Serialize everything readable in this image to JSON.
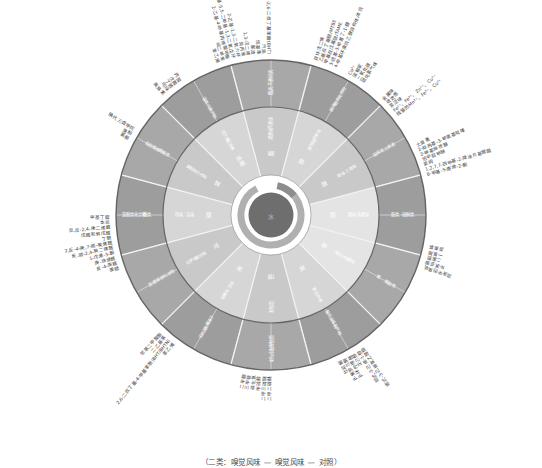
{
  "figure": {
    "caption": "（二类：嗅觉风味 — 嗅觉风味 — 对照）",
    "center_label": "水",
    "colors": {
      "outer_ring": "#a8a8a8",
      "outer_ring_alt": "#9d9d9d",
      "inner_ring": "#c9c9c9",
      "inner_ring_alt": "#d6d6d6",
      "hub_ring": "#b0b0b0",
      "hub_core": "#6e6e6e",
      "divider": "#f2f2f2",
      "edge": "#5a5a5a",
      "label_text": "#3a3a3a",
      "ring_text": "#ffffff",
      "background": "#ffffff"
    }
  },
  "chart_data": {
    "type": "pie",
    "subtitle": "",
    "xlabel": "",
    "ylabel": "",
    "legend_position": "none",
    "grid": false,
    "rings": [
      "hub",
      "inner",
      "outer",
      "external"
    ],
    "categories": [
      "芳香",
      "药味",
      "土霉味",
      "草味",
      "鱼腥味",
      "氯味",
      "金属味",
      "化学味",
      "腐败味",
      "泥土味",
      "烃味",
      "酚味"
    ],
    "values": [
      30,
      30,
      30,
      30,
      30,
      30,
      30,
      30,
      30,
      30,
      30,
      30
    ]
  },
  "wheel": {
    "hub": {
      "label": "水"
    },
    "inner_ring": [
      {
        "label": "酯"
      },
      {
        "label": "醇"
      },
      {
        "label": "醛"
      },
      {
        "label": "酮"
      },
      {
        "label": "酚"
      },
      {
        "label": "氯"
      },
      {
        "label": "硫"
      },
      {
        "label": "胺"
      },
      {
        "label": "烃"
      },
      {
        "label": "酸"
      },
      {
        "label": "醚"
      },
      {
        "label": "金属"
      }
    ],
    "mid_ring": [
      {
        "label": "芳香味 果香味"
      },
      {
        "label": "青草味 植物味"
      },
      {
        "label": "土霉味 霉味"
      },
      {
        "label": "鱼腥味 腥味"
      },
      {
        "label": "氯味 漂白水味"
      },
      {
        "label": "游泳池味"
      },
      {
        "label": "臭氧味"
      },
      {
        "label": "金属味 涩味"
      },
      {
        "label": "化学味 溶剂味"
      },
      {
        "label": "药味 苦味"
      },
      {
        "label": "腐败味 污水味"
      },
      {
        "label": "泥土味 沼泽味"
      }
    ],
    "outer_ring": [
      {
        "label": "酯类 芳香烃类"
      },
      {
        "label": "醇类 醛类化合物"
      },
      {
        "label": "萜烯类 土臭素"
      },
      {
        "label": "胺类 硫醇类"
      },
      {
        "label": "氯 氯胺类"
      },
      {
        "label": "氯代消毒副产物"
      },
      {
        "label": "臭氧 溶解性气体"
      },
      {
        "label": "金属离子 无机盐"
      },
      {
        "label": "芳香族化合物 溶剂"
      },
      {
        "label": "酚类 氯酚类化合物"
      },
      {
        "label": "醛酮类 脂肪酸类"
      },
      {
        "label": "藻类代谢产物"
      }
    ]
  },
  "external_groups": [
    {
      "group": "醚类与汽油添加剂",
      "angle_deg": -70,
      "items": [
        "双环戊二烯",
        "乙基叔丁基醚/MTBE",
        "甲基叔戊基醚/TAME",
        "3-硫基-3-甲基丁-1-醇",
        "4-甲基环庚烷乙醇异构体/本烷"
      ]
    },
    {
      "group": "芳香烃与脂环烃",
      "angle_deg": -100,
      "items": [
        "苯乙烯",
        "间二甲苯",
        "2-乙基-4-甲基丙烯酸甲酯",
        "2-乙基-5,5-二甲基-1,3-二氧戊环",
        "2-乙基-1,3-二氧六环",
        "异丙苯",
        "1,3-戊二烯",
        "鄙渣",
        "烷基苯",
        "汽油",
        "4-甲基-2,6-二叔丁基苯酚(BHT)"
      ]
    },
    {
      "group": "酚类与卤代化合物",
      "angle_deg": -150,
      "items": [
        "氯酚",
        "溴酚",
        "碘代三卤甲烷"
      ]
    },
    {
      "group": "醛酮类",
      "angle_deg": -190,
      "items": [
        "庚醛",
        "反-4-庚醛",
        "庚-炔烯醛",
        "1-戊烯-3-酮",
        "反,顺-2,4-癸二烯醛",
        "2,反-4-庚,7-顺-癸烯醛",
        "丁醛",
        "戊醛和异戊醛",
        "反,反-2,4-庚二烯醛",
        "本司",
        "甲基丁醛"
      ]
    },
    {
      "group": "抗氧剂与增塑剂",
      "angle_deg": -230,
      "items": [
        "苯乙烯",
        "2,6-二叔丁基-4-甲基苯酚(BHT/BHTN)",
        "二乙基苯",
        "邻苯二甲酸酯"
      ]
    },
    {
      "group": "胺类与硫化物",
      "angle_deg": -265,
      "items": [
        "二甲二硫醚",
        "二甲三硫醚",
        "甲硫醇",
        "硫化氢",
        "三甲胺",
        "二甲胺"
      ]
    },
    {
      "group": "萜烯与藻源化合物",
      "angle_deg": -300,
      "items": [
        "顺式-3-己烯氧乙酸酯",
        "顺式-3-己烯-1-醇",
        "正己醛",
        "β-环柠檬醛",
        "β-紫罗兰酮",
        "壮尼酮"
      ]
    },
    {
      "group": "消毒剂类",
      "angle_deg": -345,
      "items": [
        "游离氯",
        "一氯胺",
        "二氯胺",
        "N-氯亚胺",
        "溶液中的臭氧"
      ]
    },
    {
      "group": "土霉味化合物",
      "angle_deg": -20,
      "items": [
        "土臭素",
        "2-异丙基-3-甲氧基吡嗪",
        "2-甲基异莰醇",
        "倍半萜甲醚",
        "莱姆",
        "1,2,7,7-四甲基-2-降冰片基醋酸",
        "6-甲基-5-庚烯-2-酮"
      ]
    },
    {
      "group": "金属离子",
      "angle_deg": -42,
      "items": [
        "金属味",
        "收敛感",
        "苦涩味",
        "Fe²⁺、Fe³⁺、Zn²⁺、Cu²⁺",
        "残留的Mn²⁺、Fe³⁺、Cu²⁺"
      ]
    },
    {
      "group": "溶解性气体",
      "angle_deg": -58,
      "items": [
        "Cu²⁺",
        "溶解氧",
        "二氧化碳",
        "硫化氢气体"
      ]
    },
    {
      "group": "腐败与污水气味",
      "angle_deg": -128,
      "items": [
        "粪臭素",
        "吲哚",
        "丁酸",
        "戊酸",
        "丙酸"
      ]
    }
  ]
}
